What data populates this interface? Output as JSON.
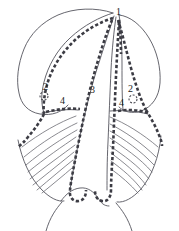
{
  "figure": {
    "width": 179,
    "height": 231,
    "background_color": "#ffffff",
    "outline_color": "#4a4a52",
    "dashed_line_color": "#3c3c44",
    "fiber_color": "#5a5a62",
    "label_color": "#1b1b1b"
  },
  "labels": [
    {
      "id": "label-1",
      "text": "1",
      "x": 116,
      "y": 7,
      "side": "center-top"
    },
    {
      "id": "label-2-left",
      "text": "2",
      "x": 43,
      "y": 82,
      "side": "left"
    },
    {
      "id": "label-2-right",
      "text": "2",
      "x": 128,
      "y": 84,
      "side": "right"
    },
    {
      "id": "label-3",
      "text": "3",
      "x": 90,
      "y": 85,
      "side": "center"
    },
    {
      "id": "label-4-left",
      "text": "4",
      "x": 60,
      "y": 96,
      "side": "left"
    },
    {
      "id": "label-4-right",
      "text": "4",
      "x": 119,
      "y": 98,
      "side": "right"
    }
  ],
  "label_values": {
    "one": "1",
    "two_left": "2",
    "two_right": "2",
    "three": "3",
    "four_left": "4",
    "four_right": "4"
  },
  "markers": [
    {
      "id": "small-circle-left",
      "cx": 44,
      "cy": 96,
      "r": 4,
      "style": "dashed"
    },
    {
      "id": "small-circle-right",
      "cx": 133,
      "cy": 99,
      "r": 4,
      "style": "dashed"
    }
  ]
}
